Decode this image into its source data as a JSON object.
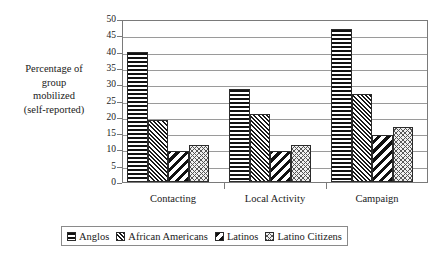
{
  "chart_data": {
    "type": "bar",
    "title": "",
    "xlabel": "",
    "ylabel": "Percentage of group mobilized (self-reported)",
    "ylabel_lines": [
      "Percentage of",
      "group",
      "mobilized",
      "(self-reported)"
    ],
    "categories": [
      "Contacting",
      "Local Activity",
      "Campaign"
    ],
    "series": [
      {
        "name": "Anglos",
        "pattern": "horizontal-stripes",
        "values": [
          40,
          28.5,
          47
        ]
      },
      {
        "name": "African Americans",
        "pattern": "dense-forward-diagonal",
        "values": [
          19,
          21,
          27
        ]
      },
      {
        "name": "Latinos",
        "pattern": "bold-backward-diagonal",
        "values": [
          9.5,
          9.5,
          14.5
        ]
      },
      {
        "name": "Latino Citizens",
        "pattern": "fine-crosshatch",
        "values": [
          11.5,
          11.5,
          17
        ]
      }
    ],
    "ylim": [
      0,
      50
    ],
    "ytick_step": 5,
    "yticks": [
      0,
      5,
      10,
      15,
      20,
      25,
      30,
      35,
      40,
      45,
      50
    ],
    "ytick_labels": [
      "0",
      "5",
      "10",
      "15",
      "20",
      "25",
      "30",
      "35",
      "40",
      "45",
      "50"
    ],
    "grid": true,
    "grid_axis": "y",
    "legend_position": "bottom",
    "colors": {
      "plot_background": "#ffffff",
      "frame": "#7a7a7a",
      "gridline": "#9a9a9a",
      "bar_outline": "#2b2b2b",
      "pattern_ink": "#111111",
      "text": "#1a1a1a"
    }
  },
  "legend": {
    "items": [
      {
        "label": "Anglos"
      },
      {
        "label": "African Americans"
      },
      {
        "label": "Latinos"
      },
      {
        "label": "Latino Citizens"
      }
    ]
  }
}
